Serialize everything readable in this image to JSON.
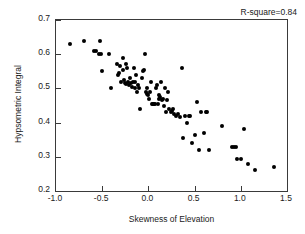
{
  "chart_data": {
    "type": "scatter",
    "title": "",
    "xlabel": "Skewness of Elevation",
    "ylabel": "Hypsometric Integral",
    "xlim": [
      -1.0,
      1.5
    ],
    "ylim": [
      0.2,
      0.7
    ],
    "xticks": [
      "-1.0",
      "-0.5",
      "0.0",
      "0.5",
      "1.0",
      "1.5"
    ],
    "xtick_values": [
      -1.0,
      -0.5,
      0.0,
      0.5,
      1.0,
      1.5
    ],
    "yticks": [
      "0.2",
      "0.3",
      "0.4",
      "0.5",
      "0.6",
      "0.7"
    ],
    "ytick_values": [
      0.2,
      0.3,
      0.4,
      0.5,
      0.6,
      0.7
    ],
    "grid": false,
    "legend": false,
    "annotations": [
      {
        "name": "r-square-annotation",
        "text": "R-square=0.84",
        "position": "top-right"
      }
    ],
    "marker": {
      "shape": "circle",
      "color": "#000000",
      "size_px": 4
    },
    "series": [
      {
        "name": "watersheds",
        "color": "#000000",
        "points": [
          [
            -0.85,
            0.63
          ],
          [
            -0.7,
            0.64
          ],
          [
            -0.59,
            0.61
          ],
          [
            -0.57,
            0.608
          ],
          [
            -0.54,
            0.6
          ],
          [
            -0.52,
            0.64
          ],
          [
            -0.51,
            0.601
          ],
          [
            -0.5,
            0.55
          ],
          [
            -0.43,
            0.6
          ],
          [
            -0.41,
            0.5
          ],
          [
            -0.34,
            0.57
          ],
          [
            -0.33,
            0.54
          ],
          [
            -0.32,
            0.545
          ],
          [
            -0.31,
            0.565
          ],
          [
            -0.3,
            0.52
          ],
          [
            -0.28,
            0.59
          ],
          [
            -0.27,
            0.555
          ],
          [
            -0.26,
            0.525
          ],
          [
            -0.25,
            0.515
          ],
          [
            -0.24,
            0.57
          ],
          [
            -0.24,
            0.512
          ],
          [
            -0.23,
            0.56
          ],
          [
            -0.22,
            0.518
          ],
          [
            -0.21,
            0.51
          ],
          [
            -0.2,
            0.53
          ],
          [
            -0.19,
            0.515
          ],
          [
            -0.18,
            0.505
          ],
          [
            -0.17,
            0.52
          ],
          [
            -0.16,
            0.56
          ],
          [
            -0.15,
            0.5
          ],
          [
            -0.14,
            0.52
          ],
          [
            -0.13,
            0.54
          ],
          [
            -0.12,
            0.49
          ],
          [
            -0.11,
            0.51
          ],
          [
            -0.1,
            0.5
          ],
          [
            -0.09,
            0.44
          ],
          [
            -0.07,
            0.53
          ],
          [
            -0.06,
            0.55
          ],
          [
            -0.05,
            0.555
          ],
          [
            -0.04,
            0.6
          ],
          [
            -0.03,
            0.49
          ],
          [
            -0.02,
            0.485
          ],
          [
            -0.01,
            0.5
          ],
          [
            0.0,
            0.48
          ],
          [
            0.01,
            0.47
          ],
          [
            0.02,
            0.49
          ],
          [
            0.03,
            0.52
          ],
          [
            0.04,
            0.455
          ],
          [
            0.05,
            0.455
          ],
          [
            0.06,
            0.455
          ],
          [
            0.07,
            0.455
          ],
          [
            0.08,
            0.5
          ],
          [
            0.09,
            0.51
          ],
          [
            0.1,
            0.455
          ],
          [
            0.11,
            0.47
          ],
          [
            0.12,
            0.48
          ],
          [
            0.13,
            0.475
          ],
          [
            0.14,
            0.52
          ],
          [
            0.15,
            0.465
          ],
          [
            0.16,
            0.47
          ],
          [
            0.17,
            0.45
          ],
          [
            0.18,
            0.5
          ],
          [
            0.19,
            0.43
          ],
          [
            0.2,
            0.465
          ],
          [
            0.21,
            0.49
          ],
          [
            0.22,
            0.44
          ],
          [
            0.24,
            0.43
          ],
          [
            0.26,
            0.435
          ],
          [
            0.27,
            0.44
          ],
          [
            0.28,
            0.425
          ],
          [
            0.3,
            0.42
          ],
          [
            0.32,
            0.425
          ],
          [
            0.34,
            0.415
          ],
          [
            0.36,
            0.56
          ],
          [
            0.37,
            0.355
          ],
          [
            0.4,
            0.42
          ],
          [
            0.42,
            0.4
          ],
          [
            0.44,
            0.42
          ],
          [
            0.45,
            0.42
          ],
          [
            0.47,
            0.34
          ],
          [
            0.5,
            0.365
          ],
          [
            0.53,
            0.46
          ],
          [
            0.55,
            0.32
          ],
          [
            0.57,
            0.43
          ],
          [
            0.6,
            0.37
          ],
          [
            0.62,
            0.43
          ],
          [
            0.63,
            0.43
          ],
          [
            0.66,
            0.32
          ],
          [
            0.8,
            0.39
          ],
          [
            0.9,
            0.33
          ],
          [
            0.93,
            0.33
          ],
          [
            0.95,
            0.33
          ],
          [
            0.96,
            0.295
          ],
          [
            1.0,
            0.295
          ],
          [
            1.03,
            0.38
          ],
          [
            1.08,
            0.28
          ],
          [
            1.15,
            0.26
          ],
          [
            1.36,
            0.27
          ]
        ]
      }
    ]
  }
}
